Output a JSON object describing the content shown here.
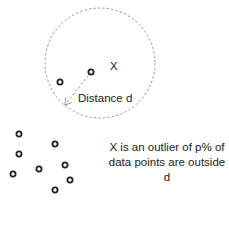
{
  "diagram": {
    "circle": {
      "cx": 100,
      "cy": 63,
      "r": 55,
      "stroke": "#9a9a9a",
      "style": "dashed"
    },
    "point_x": {
      "cx": 91,
      "cy": 72,
      "label": "X"
    },
    "distance_label": "Distance d",
    "arrow": {
      "from": [
        91,
        72
      ],
      "to": [
        64,
        106
      ],
      "color": "#9a9a9a"
    },
    "inner_points": [
      {
        "cx": 60,
        "cy": 82
      }
    ],
    "cluster_points": [
      {
        "cx": 19,
        "cy": 134
      },
      {
        "cx": 55,
        "cy": 144
      },
      {
        "cx": 19,
        "cy": 154
      },
      {
        "cx": 13,
        "cy": 174
      },
      {
        "cx": 39,
        "cy": 169
      },
      {
        "cx": 65,
        "cy": 165
      },
      {
        "cx": 70,
        "cy": 180
      },
      {
        "cx": 55,
        "cy": 190
      }
    ],
    "caption": {
      "line1": "X is an outlier of p% of",
      "line2": "data points are outside d"
    },
    "point_color": "#222222"
  }
}
